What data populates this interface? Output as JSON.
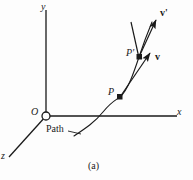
{
  "figure": {
    "caption": "(a)",
    "background_color": "#fdfdfd",
    "stroke_color": "#1a1a1a",
    "width": 193,
    "height": 180,
    "axes": {
      "y_label": "y",
      "x_label": "x",
      "z_label": "z",
      "origin_label": "O"
    },
    "annotations": {
      "path_label": "Path",
      "point_p_label": "P",
      "point_p_prime_label": "P'",
      "vector_v_label": "v",
      "vector_v_prime_label": "v'"
    },
    "geometry": {
      "origin": {
        "x": 46,
        "y": 116,
        "marker": "open-circle",
        "radius": 4
      },
      "y_axis": {
        "x1": 46,
        "y1": 10,
        "x2": 46,
        "y2": 116
      },
      "x_axis": {
        "x1": 46,
        "y1": 116,
        "x2": 177,
        "y2": 116
      },
      "z_axis": {
        "x1": 46,
        "y1": 116,
        "x2": 9,
        "y2": 157
      },
      "point_p": {
        "x": 120,
        "y": 97
      },
      "point_p_prime": {
        "x": 139,
        "y": 57
      },
      "vector_v": {
        "x1": 120,
        "y1": 97,
        "x2": 152,
        "y2": 50
      },
      "vector_v_prime": {
        "x1": 139,
        "y1": 57,
        "x2": 158,
        "y2": 17
      },
      "vector_v_translated": {
        "x1": 139,
        "y1": 57,
        "x2": 131,
        "y2": 20
      },
      "path_curve": "M 74,136 C 86,128 95,122 103,112 C 112,101 116,100 120,97 C 128,90 134,72 139,57 C 143,45 147,34 152,22",
      "path_leader": {
        "x1": 68,
        "y1": 130,
        "x2": 81,
        "y2": 134
      }
    }
  }
}
